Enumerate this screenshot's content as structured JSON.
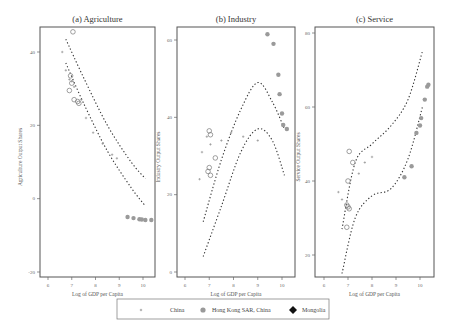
{
  "figure": {
    "legend": {
      "items": [
        {
          "label": "China",
          "marker": "plus-icon",
          "color": "#888888"
        },
        {
          "label": "Hong Kong SAR, China",
          "marker": "filled-circle-icon",
          "color": "#999999"
        },
        {
          "label": "Mongolia",
          "marker": "filled-diamond-icon",
          "color": "#111111"
        }
      ]
    }
  },
  "chart_data": [
    {
      "type": "scatter",
      "title": "(a) Agriculture",
      "xlabel": "Log of GDP per Capita",
      "ylabel": "Agriculture Output Shares",
      "xticks": [
        "6",
        "7",
        "8",
        "9",
        "10"
      ],
      "yticks": [
        "-20",
        "0",
        "20",
        "40"
      ],
      "xlim": [
        5.7,
        10.5
      ],
      "ylim": [
        -21.5,
        47
      ],
      "grid": false,
      "series": [
        {
          "name": "China (hollow circles)",
          "marker": "circle-open",
          "points": [
            [
              7.05,
              45.5
            ],
            [
              6.95,
              33.5
            ],
            [
              7.0,
              31.5
            ],
            [
              6.9,
              29.5
            ],
            [
              7.1,
              27
            ],
            [
              7.25,
              26.5
            ],
            [
              7.3,
              26
            ]
          ]
        },
        {
          "name": "China (plus)",
          "marker": "plus",
          "points": [
            [
              6.6,
              40
            ],
            [
              6.75,
              35
            ],
            [
              6.9,
              32.5
            ],
            [
              7.0,
              32
            ],
            [
              7.1,
              30.5
            ],
            [
              7.4,
              27
            ],
            [
              7.6,
              22
            ],
            [
              7.9,
              18
            ],
            [
              8.3,
              15
            ],
            [
              8.7,
              12
            ],
            [
              8.9,
              11
            ]
          ]
        },
        {
          "name": "Hong Kong SAR, China",
          "marker": "filled-circle",
          "points": [
            [
              9.35,
              -5
            ],
            [
              9.6,
              -5.3
            ],
            [
              9.85,
              -5.6
            ],
            [
              9.95,
              -5.7
            ],
            [
              10.1,
              -5.8
            ],
            [
              10.35,
              -5.8
            ]
          ]
        }
      ],
      "fit_lines": [
        {
          "name": "upper band",
          "points": [
            [
              6.75,
              43.5
            ],
            [
              7.5,
              33
            ],
            [
              8.5,
              20
            ],
            [
              9.5,
              10
            ],
            [
              10.1,
              5.5
            ]
          ]
        },
        {
          "name": "lower band",
          "points": [
            [
              6.75,
              37
            ],
            [
              7.5,
              26
            ],
            [
              8.5,
              13
            ],
            [
              9.5,
              3
            ],
            [
              10.1,
              -2
            ]
          ]
        }
      ]
    },
    {
      "type": "scatter",
      "title": "(b) Industry",
      "xlabel": "Log of GDP per Capita",
      "ylabel": "Industry Output Shares",
      "xticks": [
        "6",
        "7",
        "8",
        "9",
        "10"
      ],
      "yticks": [
        "0",
        "20",
        "40",
        "60"
      ],
      "xlim": [
        5.7,
        10.5
      ],
      "ylim": [
        -0.5,
        64
      ],
      "grid": false,
      "series": [
        {
          "name": "China (hollow circles)",
          "marker": "circle-open",
          "points": [
            [
              7.0,
              36.5
            ],
            [
              7.05,
              35.5
            ],
            [
              7.25,
              29.5
            ],
            [
              7.0,
              27
            ],
            [
              6.95,
              26
            ],
            [
              7.05,
              25
            ]
          ]
        },
        {
          "name": "China (plus)",
          "marker": "plus",
          "points": [
            [
              6.6,
              24
            ],
            [
              6.7,
              31
            ],
            [
              6.9,
              35
            ],
            [
              7.05,
              33
            ],
            [
              7.5,
              34
            ],
            [
              7.9,
              36
            ],
            [
              8.4,
              35
            ],
            [
              9.0,
              34
            ]
          ]
        },
        {
          "name": "Hong Kong SAR, China",
          "marker": "filled-circle",
          "points": [
            [
              9.4,
              61.5
            ],
            [
              9.65,
              59
            ],
            [
              9.85,
              51
            ],
            [
              9.9,
              46
            ],
            [
              10.0,
              41
            ],
            [
              10.05,
              38
            ],
            [
              10.2,
              37
            ]
          ]
        }
      ],
      "fit_lines": [
        {
          "name": "upper band",
          "points": [
            [
              6.75,
              13
            ],
            [
              7.5,
              29
            ],
            [
              8.3,
              42
            ],
            [
              9.0,
              49
            ],
            [
              9.6,
              44
            ],
            [
              10.1,
              37
            ]
          ]
        },
        {
          "name": "lower band",
          "points": [
            [
              6.75,
              4
            ],
            [
              7.5,
              17
            ],
            [
              8.3,
              31
            ],
            [
              9.0,
              37
            ],
            [
              9.6,
              34
            ],
            [
              10.1,
              25
            ]
          ]
        }
      ]
    },
    {
      "type": "scatter",
      "title": "(c) Service",
      "xlabel": "Log of GDP per Capita",
      "ylabel": "Service Output Shares",
      "xticks": [
        "6",
        "7",
        "8",
        "9",
        "10"
      ],
      "yticks": [
        "20",
        "40",
        "60",
        "80"
      ],
      "xlim": [
        5.7,
        10.5
      ],
      "ylim": [
        14,
        81
      ],
      "grid": false,
      "series": [
        {
          "name": "China (hollow circles)",
          "marker": "circle-open",
          "points": [
            [
              7.05,
              48
            ],
            [
              7.2,
              45
            ],
            [
              7.0,
              40
            ],
            [
              6.95,
              33.5
            ],
            [
              7.0,
              33
            ],
            [
              7.05,
              32.5
            ],
            [
              6.95,
              27.5
            ]
          ]
        },
        {
          "name": "China (plus)",
          "marker": "plus",
          "points": [
            [
              6.6,
              37
            ],
            [
              6.75,
              35
            ],
            [
              7.45,
              42
            ],
            [
              7.7,
              45
            ],
            [
              8.0,
              46.5
            ]
          ]
        },
        {
          "name": "Hong Kong SAR, China",
          "marker": "filled-circle",
          "points": [
            [
              9.35,
              41
            ],
            [
              9.65,
              44
            ],
            [
              9.85,
              53
            ],
            [
              10.0,
              55
            ],
            [
              10.05,
              57
            ],
            [
              10.2,
              62
            ],
            [
              10.3,
              65.5
            ],
            [
              10.35,
              66
            ]
          ]
        }
      ],
      "fit_lines": [
        {
          "name": "upper band",
          "points": [
            [
              6.75,
              27
            ],
            [
              7.3,
              45
            ],
            [
              8.0,
              50
            ],
            [
              8.8,
              55
            ],
            [
              9.5,
              62
            ],
            [
              10.1,
              75
            ]
          ]
        },
        {
          "name": "lower band",
          "points": [
            [
              6.75,
              15
            ],
            [
              7.3,
              30
            ],
            [
              8.0,
              36
            ],
            [
              8.8,
              38
            ],
            [
              9.5,
              46
            ],
            [
              10.1,
              60
            ]
          ]
        }
      ]
    }
  ]
}
